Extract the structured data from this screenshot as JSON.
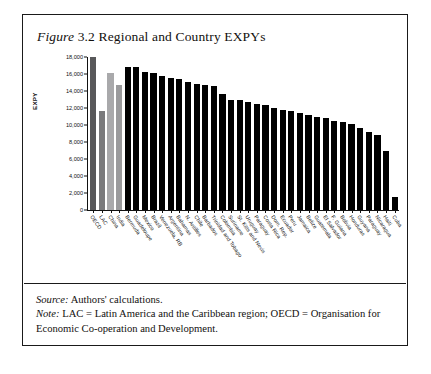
{
  "figure": {
    "label": "Figure",
    "number": "3.2",
    "title": "Regional and Country EXPYs"
  },
  "footer": {
    "source_lead": "Source:",
    "source_text": "Authors' calculations.",
    "note_lead": "Note:",
    "note_text": "LAC = Latin America and the Caribbean region; OECD = Organisation for Economic Co-operation and Development."
  },
  "chart_data": {
    "type": "bar",
    "title": "Figure 3.2 Regional and Country EXPYs",
    "xlabel": "",
    "ylabel": "EXPY",
    "ylim": [
      0,
      18000
    ],
    "yticks": [
      0,
      2000,
      4000,
      6000,
      8000,
      10000,
      12000,
      14000,
      16000,
      18000
    ],
    "ytick_labels": [
      "0",
      "2,000",
      "4,000",
      "6,000",
      "8,000",
      "10,000",
      "12,000",
      "14,000",
      "16,000",
      "18,000"
    ],
    "grid": false,
    "legend": "none",
    "colors": {
      "oecd": "#58585a",
      "lac": "#7a7a7c",
      "china": "#a9a9ab",
      "india": "#9a9a9c",
      "country": "#000000"
    },
    "categories": [
      "OECD",
      "LAC",
      "China",
      "India",
      "Bermuda",
      "Guadeloupe",
      "Mexico",
      "Brazil",
      "Venezuela, RB",
      "Argentina",
      "Bahamas",
      "N. Antilles",
      "Chile",
      "Barbados",
      "Trinidad and Tobago",
      "Colombia",
      "Suriname",
      "St. Kitts and Nevis",
      "Uruguay",
      "Paraguay",
      "Costa Rica",
      "Dom. Rep.",
      "Ecuador",
      "Peru",
      "Jamaica",
      "Belize",
      "Guatemala",
      "El Salvador",
      "F. Guiana",
      "Bolivia",
      "Honduras",
      "Guyana",
      "Paraguay",
      "Nicaragua",
      "Haiti",
      "Cuba"
    ],
    "values": [
      18000,
      11600,
      16100,
      14700,
      16800,
      16800,
      16200,
      16100,
      15800,
      15500,
      15400,
      15100,
      14800,
      14700,
      14600,
      13700,
      13000,
      12900,
      12700,
      12500,
      12300,
      12000,
      11800,
      11600,
      11400,
      11200,
      10900,
      10800,
      10500,
      10300,
      10100,
      9700,
      9200,
      8800,
      7000,
      1500
    ],
    "bar_styles": [
      "oecd",
      "lac",
      "china",
      "india",
      "country",
      "country",
      "country",
      "country",
      "country",
      "country",
      "country",
      "country",
      "country",
      "country",
      "country",
      "country",
      "country",
      "country",
      "country",
      "country",
      "country",
      "country",
      "country",
      "country",
      "country",
      "country",
      "country",
      "country",
      "country",
      "country",
      "country",
      "country",
      "country",
      "country",
      "country",
      "country"
    ]
  }
}
